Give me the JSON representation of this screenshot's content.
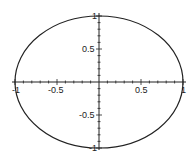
{
  "chart_data": {
    "type": "line",
    "title": "",
    "xlabel": "",
    "ylabel": "",
    "xlim": [
      -1,
      1
    ],
    "ylim": [
      -1,
      1
    ],
    "grid": false,
    "legend": null,
    "axes_style": "centered-cross",
    "series": [
      {
        "name": "unit circle",
        "equation": "x^2 + y^2 = 1",
        "color": "#222222",
        "points": [
          [
            1,
            0
          ],
          [
            0.866,
            0.5
          ],
          [
            0.5,
            0.866
          ],
          [
            0,
            1
          ],
          [
            -0.5,
            0.866
          ],
          [
            -0.866,
            0.5
          ],
          [
            -1,
            0
          ],
          [
            -0.866,
            -0.5
          ],
          [
            -0.5,
            -0.866
          ],
          [
            0,
            -1
          ],
          [
            0.5,
            -0.866
          ],
          [
            0.866,
            -0.5
          ],
          [
            1,
            0
          ]
        ]
      }
    ],
    "x_ticks": {
      "major": [
        -1,
        -0.5,
        0.5,
        1
      ],
      "labels": [
        "-1",
        "-0.5",
        "0.5",
        "1"
      ],
      "minor_step": 0.1
    },
    "y_ticks": {
      "major": [
        -1,
        -0.5,
        0.5,
        1
      ],
      "labels": [
        "-1",
        "-0.5",
        "0.5",
        "1"
      ],
      "minor_step": 0.1
    }
  }
}
